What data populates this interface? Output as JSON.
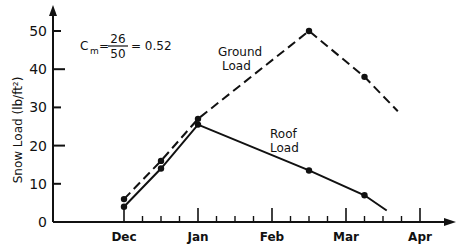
{
  "chart_data": {
    "type": "line",
    "title": "",
    "xlabel": "",
    "ylabel": "Snow Load (lb/ft²)",
    "ylim": [
      0,
      50
    ],
    "yticks": [
      0,
      10,
      20,
      30,
      40,
      50
    ],
    "ytick_labels": [
      "0",
      "10",
      "20",
      "30",
      "40",
      "50"
    ],
    "xlim_months": [
      -1.0,
      4.25
    ],
    "xticks": [
      0,
      1,
      2,
      3,
      4
    ],
    "xtick_labels": [
      "Dec",
      "Jan",
      "Feb",
      "Mar",
      "Apr"
    ],
    "minor_ticks_per_month": 4,
    "grid": false,
    "series": [
      {
        "name": "Ground Load",
        "style": "dashed",
        "points": [
          {
            "x": 0,
            "y": 6,
            "marker": true
          },
          {
            "x": 0.5,
            "y": 16,
            "marker": true
          },
          {
            "x": 1,
            "y": 27,
            "marker": true
          },
          {
            "x": 2.5,
            "y": 50,
            "marker": true
          },
          {
            "x": 3.25,
            "y": 38,
            "marker": true
          },
          {
            "x": 3.7,
            "y": 29,
            "marker": false
          }
        ]
      },
      {
        "name": "Roof Load",
        "style": "solid",
        "points": [
          {
            "x": 0,
            "y": 4,
            "marker": true
          },
          {
            "x": 0.5,
            "y": 14,
            "marker": true
          },
          {
            "x": 1,
            "y": 25.5,
            "marker": true
          },
          {
            "x": 2.5,
            "y": 13.5,
            "marker": true
          },
          {
            "x": 3.25,
            "y": 7,
            "marker": true
          },
          {
            "x": 3.55,
            "y": 3,
            "marker": false
          }
        ]
      }
    ],
    "annotations": {
      "formula_lhs": "C",
      "formula_sub": "m",
      "formula_num": "26",
      "formula_den": "50",
      "formula_result": "= 0.52",
      "ground_label": [
        "Ground",
        "Load"
      ],
      "roof_label": [
        "Roof",
        "Load"
      ]
    }
  }
}
